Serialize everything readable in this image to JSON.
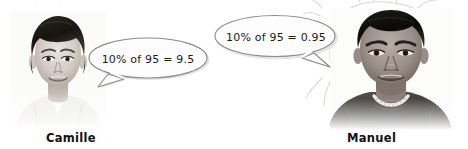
{
  "scene": {
    "width": 468,
    "height": 149,
    "background_color": "#ffffff",
    "top_remnant_text": "· · ·  ·  ·"
  },
  "people": [
    {
      "id": "camille",
      "name": "Camille",
      "photo_alt": "grayscale portrait of a young woman with short dark hair wearing a white top",
      "quote": "10% of 95 = 9.5",
      "quote_tail_direction": "down-left"
    },
    {
      "id": "manuel",
      "name": "Manuel",
      "photo_alt": "grayscale portrait of a young man with short dark hair wearing a dark shirt and a beaded necklace",
      "quote": "10% of 95 = 0.95",
      "quote_tail_direction": "down-right"
    }
  ],
  "colors": {
    "bubble_fill": "#fdfdfd",
    "bubble_stroke": "#8a8a8a",
    "bubble_shadow": "#d6d6d6",
    "text": "#1b1b1b",
    "caption": "#111111",
    "sketch_line": "#d8d8d8"
  }
}
